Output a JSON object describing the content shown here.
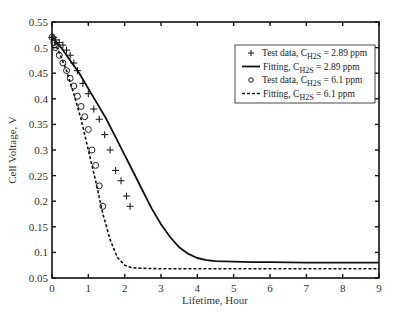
{
  "chart_data": {
    "type": "line",
    "title": "",
    "xlabel": "Lifetime, Hour",
    "ylabel": "Cell Voltage, V",
    "xlim": [
      0,
      9
    ],
    "ylim": [
      0.05,
      0.55
    ],
    "xticks": [
      0,
      1,
      2,
      3,
      4,
      5,
      6,
      7,
      8,
      9
    ],
    "yticks": [
      0.05,
      0.1,
      0.15,
      0.2,
      0.25,
      0.3,
      0.35,
      0.4,
      0.45,
      0.5,
      0.55
    ],
    "grid": false,
    "legend_position": "upper right",
    "series": [
      {
        "name": "Test data, C_H2S = 2.89 ppm",
        "legend_main": "Test data, C",
        "legend_sub": "H2S",
        "legend_tail": " = 2.89 ppm",
        "style": "plus",
        "x": [
          0.0,
          0.05,
          0.1,
          0.2,
          0.3,
          0.4,
          0.5,
          0.6,
          0.7,
          0.85,
          1.0,
          1.15,
          1.3,
          1.45,
          1.6,
          1.75,
          1.9,
          2.05,
          2.15
        ],
        "y": [
          0.52,
          0.52,
          0.515,
          0.51,
          0.505,
          0.495,
          0.485,
          0.47,
          0.455,
          0.43,
          0.41,
          0.38,
          0.36,
          0.33,
          0.3,
          0.26,
          0.24,
          0.21,
          0.19
        ]
      },
      {
        "name": "Fitting, C_H2S = 2.89 ppm",
        "legend_main": "Fitting, C",
        "legend_sub": "H2S",
        "legend_tail": " = 2.89 ppm",
        "style": "solid",
        "x": [
          0.0,
          0.25,
          0.5,
          0.75,
          1.0,
          1.25,
          1.5,
          1.75,
          2.0,
          2.25,
          2.5,
          2.75,
          3.0,
          3.25,
          3.5,
          3.75,
          4.0,
          4.25,
          4.5,
          5.0,
          5.5,
          6.0,
          7.0,
          8.0,
          9.0
        ],
        "y": [
          0.52,
          0.5,
          0.475,
          0.45,
          0.42,
          0.39,
          0.36,
          0.325,
          0.29,
          0.255,
          0.22,
          0.185,
          0.155,
          0.13,
          0.11,
          0.097,
          0.089,
          0.085,
          0.083,
          0.082,
          0.081,
          0.081,
          0.08,
          0.08,
          0.08
        ]
      },
      {
        "name": "Test data, C_H2S = 6.1 ppm",
        "legend_main": "Test data, C",
        "legend_sub": "H2S",
        "legend_tail": " = 6.1 ppm",
        "style": "circle",
        "x": [
          0.0,
          0.05,
          0.1,
          0.2,
          0.3,
          0.4,
          0.5,
          0.6,
          0.7,
          0.8,
          0.9,
          1.0,
          1.1,
          1.2,
          1.3,
          1.4
        ],
        "y": [
          0.52,
          0.51,
          0.5,
          0.485,
          0.47,
          0.455,
          0.44,
          0.425,
          0.405,
          0.385,
          0.365,
          0.34,
          0.3,
          0.27,
          0.23,
          0.19
        ]
      },
      {
        "name": "Fitting, C_H2S = 6.1 ppm",
        "legend_main": "Fitting, C",
        "legend_sub": "H2S",
        "legend_tail": " = 6.1 ppm",
        "style": "dashed",
        "x": [
          0.0,
          0.2,
          0.4,
          0.6,
          0.8,
          1.0,
          1.2,
          1.4,
          1.6,
          1.8,
          2.0,
          2.2,
          2.5,
          3.0,
          4.0,
          5.0,
          6.0,
          7.0,
          8.0,
          9.0
        ],
        "y": [
          0.52,
          0.49,
          0.455,
          0.41,
          0.36,
          0.3,
          0.24,
          0.175,
          0.125,
          0.09,
          0.075,
          0.07,
          0.069,
          0.068,
          0.068,
          0.068,
          0.068,
          0.068,
          0.068,
          0.068
        ]
      }
    ]
  }
}
